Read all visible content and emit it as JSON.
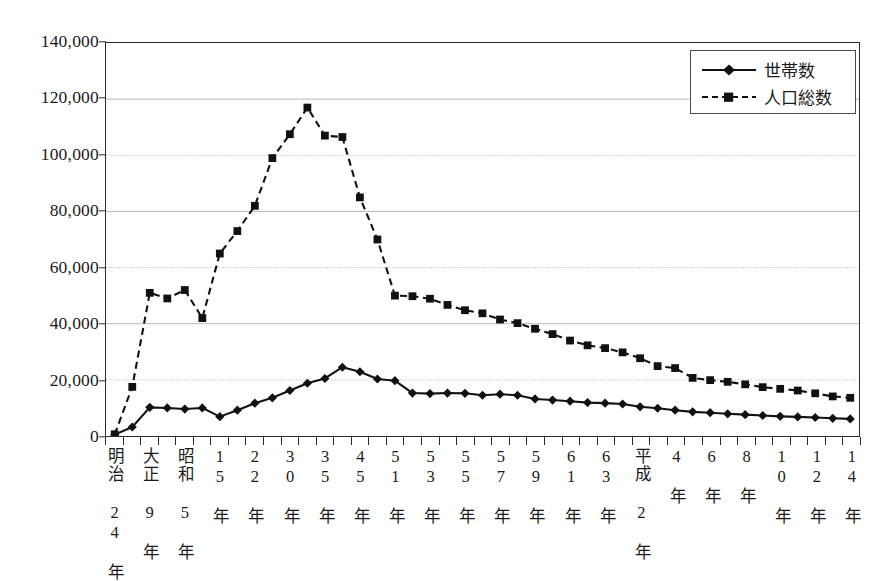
{
  "chart_data": {
    "type": "line",
    "title": "",
    "xlabel": "",
    "ylabel": "",
    "ylim": [
      0,
      140000
    ],
    "ytick_step": 20000,
    "grid": true,
    "grid_color": "#b9b9b9",
    "legend_position": "top-right",
    "ytick_labels": [
      "140,000",
      "120,000",
      "100,000",
      "80,000",
      "60,000",
      "40,000",
      "20,000",
      "0"
    ],
    "ytick_values": [
      140000,
      120000,
      100000,
      80000,
      60000,
      40000,
      20000,
      0
    ],
    "categories": [
      "明治 24 年",
      "",
      "大正 9 年",
      "",
      "昭和 5 年",
      "",
      "15 年",
      "",
      "22 年",
      "",
      "30 年",
      "",
      "35 年",
      "",
      "45 年",
      "",
      "51 年",
      "",
      "53 年",
      "",
      "55 年",
      "",
      "57 年",
      "",
      "59 年",
      "",
      "61 年",
      "",
      "63 年",
      "",
      "平成 2 年",
      "",
      "4 年",
      "",
      "6 年",
      "",
      "8 年",
      "",
      "10 年",
      "",
      "12 年",
      "",
      "14 年"
    ],
    "xtick_labels_visible": [
      {
        "index": 0,
        "label": "明治 24 年"
      },
      {
        "index": 2,
        "label": "大正 9 年"
      },
      {
        "index": 4,
        "label": "昭和 5 年"
      },
      {
        "index": 6,
        "label": "15 年"
      },
      {
        "index": 8,
        "label": "22 年"
      },
      {
        "index": 10,
        "label": "30 年"
      },
      {
        "index": 12,
        "label": "35 年"
      },
      {
        "index": 14,
        "label": "45 年"
      },
      {
        "index": 16,
        "label": "51 年"
      },
      {
        "index": 18,
        "label": "53 年"
      },
      {
        "index": 20,
        "label": "55 年"
      },
      {
        "index": 22,
        "label": "57 年"
      },
      {
        "index": 24,
        "label": "59 年"
      },
      {
        "index": 26,
        "label": "61 年"
      },
      {
        "index": 28,
        "label": "63 年"
      },
      {
        "index": 30,
        "label": "平成 2 年"
      },
      {
        "index": 32,
        "label": "4 年"
      },
      {
        "index": 34,
        "label": "6 年"
      },
      {
        "index": 36,
        "label": "8 年"
      },
      {
        "index": 38,
        "label": "10 年"
      },
      {
        "index": 40,
        "label": "12 年"
      },
      {
        "index": 42,
        "label": "14 年"
      }
    ],
    "series": [
      {
        "name": "世帯数",
        "style": "solid",
        "marker": "diamond",
        "color": "#111111",
        "values": [
          500,
          3200,
          10200,
          10000,
          9600,
          10000,
          6900,
          9200,
          11700,
          13600,
          16200,
          18800,
          20500,
          24500,
          22900,
          20300,
          19700,
          15300,
          15100,
          15300,
          15200,
          14500,
          14900,
          14500,
          13200,
          12800,
          12400,
          11900,
          11700,
          11400,
          10400,
          9900,
          9200,
          8600,
          8300,
          7900,
          7600,
          7300,
          7000,
          6800,
          6600,
          6300,
          6100
        ]
      },
      {
        "name": "人口総数",
        "style": "dashed",
        "marker": "square",
        "color": "#111111",
        "values": [
          600,
          17500,
          51000,
          49000,
          52000,
          42000,
          65000,
          73000,
          82000,
          99000,
          107500,
          117000,
          107000,
          106500,
          85000,
          70000,
          50000,
          49800,
          48900,
          46700,
          44800,
          43700,
          41500,
          40200,
          38200,
          36300,
          34000,
          32300,
          31300,
          29800,
          27700,
          24900,
          24200,
          20700,
          19900,
          19300,
          18400,
          17400,
          16800,
          16200,
          15200,
          14100,
          13600
        ]
      }
    ]
  },
  "legend": {
    "items": [
      {
        "label": "世帯数",
        "style": "solid",
        "marker": "diamond"
      },
      {
        "label": "人口総数",
        "style": "dashed",
        "marker": "square"
      }
    ]
  }
}
